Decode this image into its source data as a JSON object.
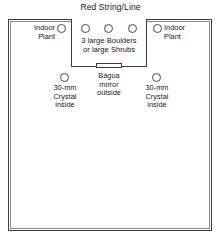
{
  "diagram": {
    "title": "Red String/Line",
    "center_box": {
      "label": "3 large Boulders\nor large Shrubs",
      "label_line1": "3 large Boulders",
      "label_line2": "or large Shrubs",
      "markers": [
        "boulder-1",
        "boulder-2",
        "boulder-3"
      ]
    },
    "gate": {
      "name": "gate-opening"
    },
    "plants": [
      {
        "id": "indoor-plant-left",
        "label_line1": "Indoor",
        "label_line2": "Plant",
        "marker": "circle"
      },
      {
        "id": "indoor-plant-right",
        "label_line1": "Indoor",
        "label_line2": "Plant",
        "marker": "circle"
      }
    ],
    "crystals": [
      {
        "id": "crystal-left",
        "label_line1": "30-mm",
        "label_line2": "Crystal",
        "label_line3": "inside",
        "marker": "circle"
      },
      {
        "id": "crystal-right",
        "label_line1": "30-mm",
        "label_line2": "Crystal",
        "label_line3": "inside",
        "marker": "circle"
      }
    ],
    "bagua": {
      "id": "bagua-mirror",
      "label_line1": "Bagua",
      "label_line2": "mirror",
      "label_line3": "outside"
    },
    "colors": {
      "line": "#3b3b3b",
      "line_light": "#8c8c8c",
      "text": "#1a1a1a",
      "background": "#ffffff"
    }
  }
}
